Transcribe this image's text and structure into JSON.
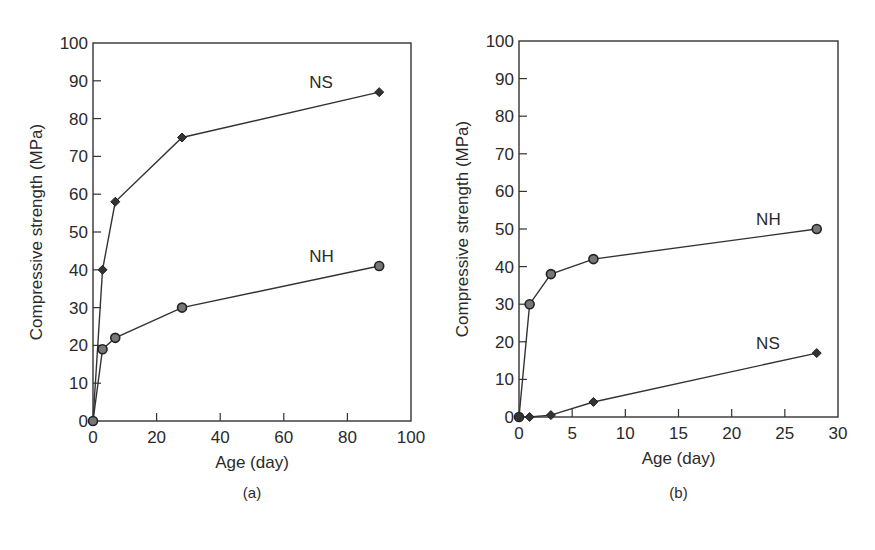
{
  "chart_data": [
    {
      "id": "a",
      "type": "line",
      "caption": "(a)",
      "title": "",
      "xlabel": "Age (day)",
      "ylabel": "Compressive strength (MPa)",
      "xlim": [
        0,
        100
      ],
      "ylim": [
        0,
        100
      ],
      "xticks": [
        0,
        20,
        40,
        60,
        80,
        100
      ],
      "yticks": [
        0,
        10,
        20,
        30,
        40,
        50,
        60,
        70,
        80,
        90,
        100
      ],
      "grid": false,
      "legend": "inline labels",
      "series": [
        {
          "name": "NS",
          "marker": "diamond",
          "label_at": [
            68,
            88
          ],
          "x": [
            0,
            3,
            7,
            28,
            90
          ],
          "y": [
            0,
            40,
            58,
            75,
            87
          ]
        },
        {
          "name": "NH",
          "marker": "circle",
          "label_at": [
            68,
            42
          ],
          "x": [
            0,
            3,
            7,
            28,
            90
          ],
          "y": [
            0,
            19,
            22,
            30,
            41
          ]
        }
      ]
    },
    {
      "id": "b",
      "type": "line",
      "caption": "(b)",
      "title": "",
      "xlabel": "Age (day)",
      "ylabel": "Compressive strength (MPa)",
      "xlim": [
        0,
        30
      ],
      "ylim": [
        0,
        100
      ],
      "xticks": [
        0,
        5,
        10,
        15,
        20,
        25,
        30
      ],
      "yticks": [
        0,
        10,
        20,
        30,
        40,
        50,
        60,
        70,
        80,
        90,
        100
      ],
      "grid": false,
      "legend": "inline labels",
      "series": [
        {
          "name": "NH",
          "marker": "circle",
          "label_at": [
            22.3,
            51
          ],
          "x": [
            0,
            1,
            3,
            7,
            28
          ],
          "y": [
            0,
            30,
            38,
            42,
            50
          ]
        },
        {
          "name": "NS",
          "marker": "diamond",
          "label_at": [
            22.3,
            18
          ],
          "x": [
            0,
            1,
            3,
            7,
            28
          ],
          "y": [
            0,
            0,
            0.5,
            4,
            17
          ]
        }
      ]
    }
  ]
}
